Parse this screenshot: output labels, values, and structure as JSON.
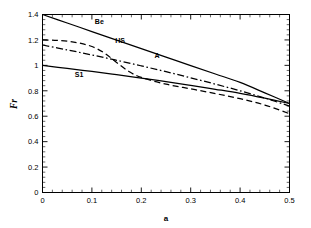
{
  "chart_data": {
    "type": "line",
    "title": "",
    "xlabel": "a",
    "ylabel": "Fr",
    "xlim": [
      0,
      0.5
    ],
    "ylim": [
      0,
      1.4
    ],
    "xticks": [
      "0",
      "0.1",
      "0.2",
      "0.3",
      "0.4",
      "0.5"
    ],
    "xtick_values": [
      0,
      0.1,
      0.2,
      0.3,
      0.4,
      0.5
    ],
    "yticks": [
      "0",
      "0.2",
      "0.4",
      "0.6",
      "0.8",
      "1",
      "1.2",
      "1.4"
    ],
    "ytick_values": [
      0,
      0.2,
      0.4,
      0.6,
      0.8,
      1.0,
      1.2,
      1.4
    ],
    "minor_ticks_per_interval": 5,
    "grid": false,
    "legend": "inline-curve-labels",
    "axis_color": "#000000",
    "series": [
      {
        "name": "Be",
        "label": "Be",
        "style": "solid",
        "color": "#000000",
        "label_x": 0.115,
        "label_y": 1.325,
        "x": [
          0,
          0.05,
          0.1,
          0.15,
          0.2,
          0.25,
          0.3,
          0.35,
          0.4,
          0.45,
          0.5
        ],
        "y": [
          1.4,
          1.333,
          1.266,
          1.199,
          1.132,
          1.065,
          0.998,
          0.932,
          0.866,
          0.784,
          0.7
        ]
      },
      {
        "name": "HS",
        "label": "HS",
        "style": "dashed",
        "color": "#000000",
        "label_x": 0.157,
        "label_y": 1.175,
        "x": [
          0,
          0.025,
          0.05,
          0.075,
          0.1,
          0.125,
          0.15,
          0.175,
          0.2,
          0.25,
          0.3,
          0.35,
          0.4,
          0.45,
          0.5
        ],
        "y": [
          1.2,
          1.197,
          1.19,
          1.175,
          1.148,
          1.098,
          1.022,
          0.952,
          0.905,
          0.852,
          0.815,
          0.778,
          0.738,
          0.688,
          0.62
        ]
      },
      {
        "name": "A",
        "label": "A",
        "style": "dashdot",
        "color": "#000000",
        "label_x": 0.232,
        "label_y": 1.055,
        "x": [
          0,
          0.05,
          0.1,
          0.15,
          0.2,
          0.25,
          0.3,
          0.35,
          0.4,
          0.45,
          0.5
        ],
        "y": [
          1.16,
          1.122,
          1.082,
          1.04,
          0.996,
          0.95,
          0.902,
          0.852,
          0.8,
          0.743,
          0.68
        ]
      },
      {
        "name": "S1",
        "label": "S1",
        "style": "solid",
        "color": "#000000",
        "label_x": 0.074,
        "label_y": 0.905,
        "x": [
          0,
          0.05,
          0.1,
          0.15,
          0.2,
          0.25,
          0.3,
          0.35,
          0.4,
          0.45,
          0.5
        ],
        "y": [
          1.0,
          0.976,
          0.952,
          0.927,
          0.9,
          0.872,
          0.843,
          0.812,
          0.78,
          0.742,
          0.7
        ]
      }
    ]
  }
}
